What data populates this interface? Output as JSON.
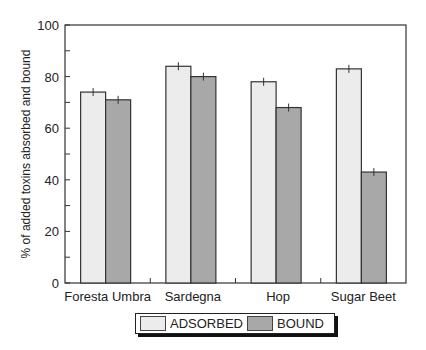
{
  "chart_data": {
    "type": "bar",
    "title": "",
    "xlabel": "",
    "ylabel": "% of added toxins absorbed and bound",
    "ylim": [
      0,
      100
    ],
    "yticks": [
      0,
      20,
      40,
      60,
      80,
      100
    ],
    "grid": false,
    "legend_position": "bottom",
    "categories": [
      "Foresta Umbra",
      "Sardegna",
      "Hop",
      "Sugar Beet"
    ],
    "series": [
      {
        "name": "ADSORBED",
        "color": "#ececec",
        "values": [
          74,
          84,
          78,
          83
        ]
      },
      {
        "name": "BOUND",
        "color": "#a8a8a8",
        "values": [
          71,
          80,
          68,
          43
        ]
      }
    ],
    "error_bars": true
  },
  "legend": {
    "items": [
      {
        "label": "ADSORBED",
        "color": "#ececec"
      },
      {
        "label": "BOUND",
        "color": "#a8a8a8"
      }
    ]
  }
}
